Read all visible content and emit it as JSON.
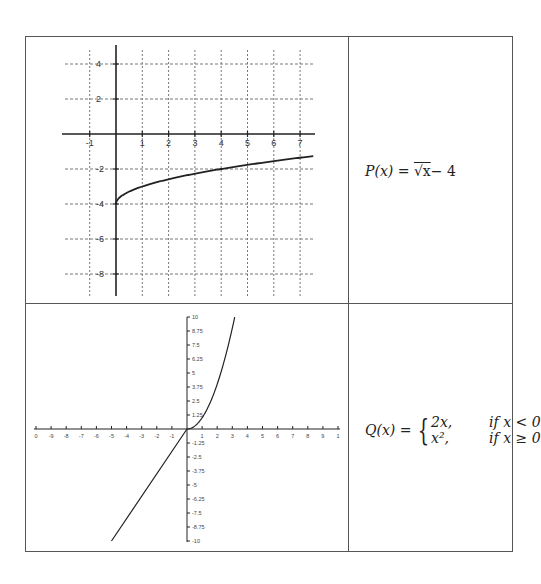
{
  "chart_data": [
    {
      "type": "line",
      "title": "",
      "function": "P(x) = sqrt(x) - 4",
      "xlabel": "",
      "ylabel": "",
      "xlim": [
        -1.8,
        7.5
      ],
      "ylim": [
        -9.2,
        5
      ],
      "grid": true,
      "grid_style": "dashed",
      "x_ticks": [
        -1,
        1,
        2,
        3,
        4,
        5,
        6,
        7
      ],
      "y_ticks": [
        4,
        2,
        -2,
        -4,
        -6,
        -8
      ],
      "x_tick_labels": [
        "-1",
        "1",
        "2",
        "3",
        "4",
        "5",
        "6",
        "7"
      ],
      "y_tick_labels": [
        "4",
        "2",
        "-2",
        "-4",
        "-6",
        "-8"
      ],
      "series": [
        {
          "name": "P(x)",
          "x": [
            0,
            0.05,
            0.25,
            0.5,
            1,
            2,
            3,
            4,
            5,
            6,
            7,
            7.5
          ],
          "values": [
            -4,
            -3.78,
            -3.5,
            -3.29,
            -3,
            -2.59,
            -2.27,
            -2,
            -1.76,
            -1.55,
            -1.35,
            -1.26
          ]
        }
      ]
    },
    {
      "type": "line",
      "title": "",
      "function": "Q(x) = 2x if x < 0; x^2 if x >= 0",
      "xlabel": "",
      "ylabel": "",
      "xlim": [
        -10,
        10
      ],
      "ylim": [
        -10,
        10
      ],
      "grid": false,
      "x_ticks": [
        -10,
        -9,
        -8,
        -7,
        -6,
        -5,
        -4,
        -3,
        -2,
        -1,
        1,
        2,
        3,
        4,
        5,
        6,
        7,
        8,
        9,
        10
      ],
      "x_tick_labels": [
        "0",
        "-9",
        "-8",
        "-7",
        "-6",
        "-5",
        "-4",
        "-3",
        "-2",
        "-1",
        "1",
        "2",
        "3",
        "4",
        "5",
        "6",
        "7",
        "8",
        "9",
        "1"
      ],
      "y_ticks": [
        10,
        8.75,
        7.5,
        6.25,
        5,
        3.75,
        2.5,
        1.25,
        -1.25,
        -2.5,
        -3.75,
        -5,
        -6.25,
        -7.5,
        -8.75,
        -10
      ],
      "y_tick_labels": [
        "10",
        "8.75",
        "7.5",
        "6.25",
        "5",
        "3.75",
        "2.5",
        "1.25",
        "-1.25",
        "-2.5",
        "-3.75",
        "-5",
        "-6.25",
        "-7.5",
        "-8.75",
        "-10"
      ],
      "series": [
        {
          "name": "Q(x)",
          "x": [
            -5,
            -4,
            -3,
            -2,
            -1,
            0,
            0.5,
            1,
            1.5,
            2,
            2.5,
            3,
            3.16
          ],
          "values": [
            -10,
            -8,
            -6,
            -4,
            -2,
            0,
            0.25,
            1,
            2.25,
            4,
            6.25,
            9,
            10
          ]
        }
      ]
    }
  ],
  "table": {
    "rows": [
      {
        "graph": "graph-sqrt",
        "formula": {
          "lhs": "P(x) = ",
          "rhs": "√x",
          "tail": "− 4"
        }
      },
      {
        "graph": "graph-piecewise",
        "formula": {
          "lhs": "Q(x) = ",
          "case1_expr": "2x,",
          "case1_cond": "if x < 0",
          "case2_expr": "x²,",
          "case2_cond": "if x ≥ 0"
        }
      }
    ]
  },
  "colors": {
    "border": "#555555",
    "axis": "#222222",
    "grid": "#777777",
    "curve": "#222222"
  }
}
